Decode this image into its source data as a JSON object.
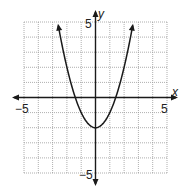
{
  "chart_data": {
    "type": "line",
    "title": "",
    "function": "y = x^2 - 2",
    "xlabel": "x",
    "ylabel": "y",
    "xlim": [
      -5,
      5
    ],
    "ylim": [
      -5,
      5
    ],
    "grid": true,
    "grid_step": 1,
    "tick_labels": {
      "x_min": "−5",
      "x_max": "5",
      "y_min": "−5",
      "y_max": "5"
    },
    "series": [
      {
        "name": "parabola",
        "x": [
          -2.6,
          -2,
          -1.5,
          -1.414,
          -1,
          -0.5,
          0,
          0.5,
          1,
          1.414,
          1.5,
          2,
          2.6
        ],
        "y": [
          4.76,
          2,
          0.25,
          0,
          -1,
          -1.75,
          -2,
          -1.75,
          -1,
          0,
          0.25,
          2,
          4.76
        ]
      }
    ],
    "annotations": {
      "vertex": [
        0,
        -2
      ],
      "x_intercepts": [
        -1.414,
        1.414
      ],
      "arrows_on_curve_ends": true,
      "arrows_on_axes": true
    },
    "colors": {
      "curve": "#1a1a1a",
      "axes": "#1a1a1a",
      "grid": "#9a9a9a"
    }
  },
  "labels": {
    "x_axis": "x",
    "y_axis": "y",
    "x_min": "−5",
    "x_max": "5",
    "y_max": "5",
    "y_min": "−5"
  }
}
